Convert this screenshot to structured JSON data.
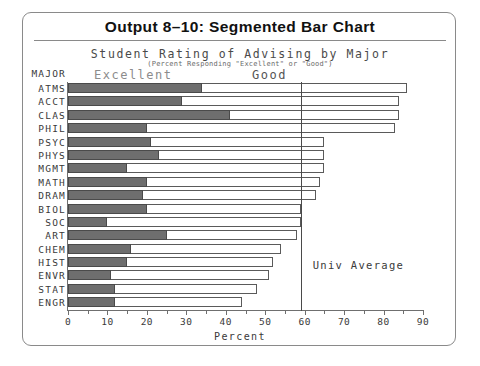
{
  "figure": {
    "title": "Output 8–10:  Segmented Bar Chart",
    "subtitle": "Student Rating of Advising by Major",
    "subsubtitle": "(Percent Responding \"Excellent\" or \"Good\")",
    "y_axis_header": "MAJOR",
    "x_axis_title": "Percent",
    "reference_label": "Univ Average",
    "legend": {
      "excellent": "Excellent",
      "good": "Good"
    },
    "colors": {
      "excellent_fill": "#6e6e6e",
      "good_fill": "#ffffff",
      "outline": "#5a5a5a",
      "axis": "#6f6f6f",
      "frame": "#8a8a8a",
      "text": "#3a3a3a"
    }
  },
  "chart_data": {
    "type": "bar",
    "orientation": "horizontal",
    "stacked": true,
    "title": "Output 8–10:  Segmented Bar Chart",
    "subtitle": "Student Rating of Advising by Major",
    "annotation": "(Percent Responding \"Excellent\" or \"Good\")",
    "xlabel": "Percent",
    "ylabel": "MAJOR",
    "xlim": [
      0,
      90
    ],
    "xticks": [
      0,
      10,
      20,
      30,
      40,
      50,
      60,
      70,
      80,
      90
    ],
    "xticklabels": [
      "0",
      "10",
      "20",
      "30",
      "40",
      "50",
      "60",
      "70",
      "80",
      "90"
    ],
    "grid": false,
    "legend_position": "top",
    "reference_line": {
      "label": "Univ Average",
      "value": 59
    },
    "categories": [
      "ATMS",
      "ACCT",
      "CLAS",
      "PHIL",
      "PSYC",
      "PHYS",
      "MGMT",
      "MATH",
      "DRAM",
      "BIOL",
      "SOC",
      "ART",
      "CHEM",
      "HIST",
      "ENVR",
      "STAT",
      "ENGR"
    ],
    "series": [
      {
        "name": "Excellent",
        "color": "#6e6e6e",
        "values": [
          34,
          29,
          41,
          20,
          21,
          23,
          15,
          20,
          19,
          20,
          10,
          25,
          16,
          15,
          11,
          12,
          12
        ]
      },
      {
        "name": "Good",
        "color": "#ffffff",
        "values": [
          52,
          55,
          43,
          63,
          44,
          42,
          50,
          44,
          44,
          39,
          49,
          33,
          38,
          37,
          40,
          36,
          32
        ]
      }
    ],
    "totals": [
      86,
      84,
      84,
      83,
      65,
      65,
      65,
      64,
      63,
      59,
      59,
      58,
      54,
      52,
      51,
      48,
      44
    ]
  }
}
